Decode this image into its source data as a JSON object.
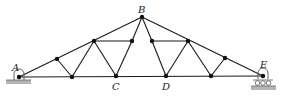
{
  "diagram": {
    "type": "roof truss",
    "line_color": "#1a1a1a",
    "ground_color": "#9a9a9a",
    "labels": {
      "A": "A",
      "B": "B",
      "C": "C",
      "D": "D",
      "E": "E"
    },
    "supports": {
      "A": "pin",
      "E": "roller"
    },
    "nodes": {
      "A": [
        19,
        77
      ],
      "n1": [
        57,
        59
      ],
      "n2": [
        94,
        41
      ],
      "B": [
        142,
        17
      ],
      "n3": [
        132,
        41
      ],
      "n4": [
        152,
        41
      ],
      "n5": [
        188,
        41
      ],
      "n6": [
        225,
        58
      ],
      "E": [
        263,
        76
      ],
      "b1": [
        72,
        77
      ],
      "C": [
        116,
        76
      ],
      "D": [
        166,
        76
      ],
      "b2": [
        211,
        76
      ]
    }
  }
}
